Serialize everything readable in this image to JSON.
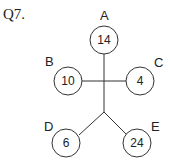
{
  "question": {
    "label": "Q7."
  },
  "nodes": [
    {
      "id": "A",
      "value": "14",
      "cx": 104,
      "cy": 40,
      "lx": 100,
      "ly": 20
    },
    {
      "id": "B",
      "value": "10",
      "cx": 68,
      "cy": 81,
      "lx": 45,
      "ly": 66
    },
    {
      "id": "C",
      "value": "4",
      "cx": 140,
      "cy": 81,
      "lx": 154,
      "ly": 67
    },
    {
      "id": "D",
      "value": "6",
      "cx": 66,
      "cy": 143,
      "lx": 44,
      "ly": 131
    },
    {
      "id": "E",
      "value": "24",
      "cx": 137,
      "cy": 143,
      "lx": 151,
      "ly": 131
    }
  ]
}
